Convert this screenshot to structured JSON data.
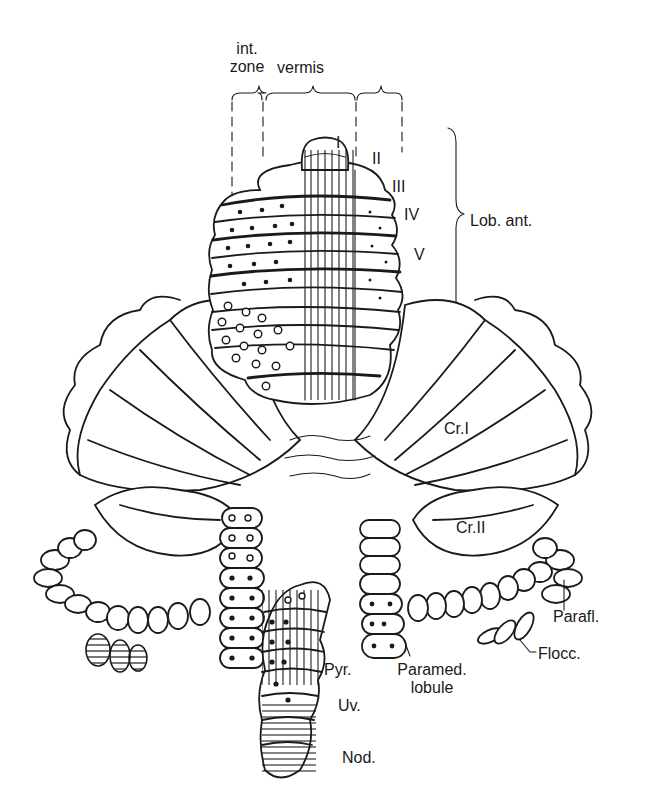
{
  "figure": {
    "type": "anatomical line drawing",
    "colors": {
      "ink": "#1a1a1a",
      "background": "#ffffff"
    }
  },
  "labels": {
    "int_zone": [
      "int.",
      "zone"
    ],
    "vermis": "vermis",
    "lobules": [
      "I",
      "II",
      "III",
      "IV",
      "V"
    ],
    "lob_ant": "Lob. ant.",
    "cr_i": "Cr.I",
    "cr_ii": "Cr.II",
    "parafl": "Parafl.",
    "flocc": "Flocc.",
    "paramed": [
      "Paramed.",
      "lobule"
    ],
    "pyr": "Pyr.",
    "uv": "Uv.",
    "nod": "Nod."
  },
  "legend_markers": {
    "filled_dot": "filled circle markers",
    "open_circle": "open circle markers",
    "vertical_hatching": "vertical line hatching",
    "horizontal_hatching": "horizontal line hatching"
  }
}
